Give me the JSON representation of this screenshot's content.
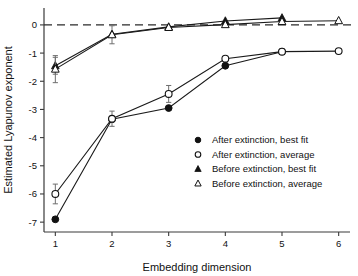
{
  "chart_data": {
    "type": "line",
    "title": "",
    "xlabel": "Embedding dimension",
    "ylabel": "Estimated Lyapunov exponent",
    "x": [
      1,
      2,
      3,
      4,
      5,
      6
    ],
    "xlim": [
      0.8,
      6.2
    ],
    "ylim": [
      -7.35,
      0.6
    ],
    "xticks": [
      "1",
      "2",
      "3",
      "4",
      "5",
      "6"
    ],
    "yticks": [
      "0",
      "-1",
      "-2",
      "-3",
      "-4",
      "-5",
      "-6",
      "-7"
    ],
    "ytick_values": [
      0,
      -1,
      -2,
      -3,
      -4,
      -5,
      -6,
      -7
    ],
    "grid": false,
    "zero_reference_line": 0,
    "legend_position": "center-right",
    "series": [
      {
        "name": "After extinction, best fit",
        "marker": "filled-circle",
        "x": [
          1,
          2,
          3,
          4,
          5
        ],
        "values": [
          -6.9,
          -3.35,
          -2.95,
          -1.45,
          -0.95
        ],
        "errors": [
          null,
          null,
          null,
          null,
          null
        ]
      },
      {
        "name": "After extinction, average",
        "marker": "open-circle",
        "x": [
          1,
          2,
          3,
          4,
          5,
          6
        ],
        "values": [
          -6.0,
          -3.33,
          -2.45,
          -1.2,
          -0.95,
          -0.93
        ],
        "errors": [
          0.35,
          0.27,
          0.3,
          null,
          null,
          null
        ]
      },
      {
        "name": "Before extinction, best fit",
        "marker": "filled-triangle",
        "x": [
          1,
          2,
          3,
          4,
          5
        ],
        "values": [
          -1.45,
          -0.33,
          -0.07,
          0.14,
          0.25
        ],
        "errors": [
          0.3,
          null,
          null,
          null,
          null
        ]
      },
      {
        "name": "Before extinction, average",
        "marker": "open-triangle",
        "x": [
          1,
          2,
          3,
          4,
          5,
          6
        ],
        "values": [
          -1.57,
          -0.35,
          -0.09,
          0.01,
          0.12,
          0.15
        ],
        "errors": [
          0.48,
          0.32,
          null,
          null,
          null,
          null
        ]
      }
    ]
  },
  "legend": {
    "entries": [
      {
        "marker": "filled-circle-icon",
        "label": "After extinction, best fit"
      },
      {
        "marker": "open-circle-icon",
        "label": "After extinction, average"
      },
      {
        "marker": "filled-triangle-icon",
        "label": "Before extinction, best fit"
      },
      {
        "marker": "open-triangle-icon",
        "label": "Before extinction, average"
      }
    ]
  },
  "colors": {
    "line": "#1a1a1a",
    "axis": "#3a3a3a",
    "errorbar": "#6e6e6e",
    "background": "#ffffff"
  }
}
